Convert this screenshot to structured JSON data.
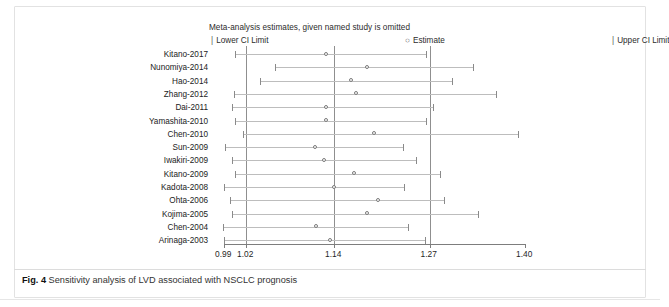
{
  "figure": {
    "caption_label": "Fig. 4",
    "caption_text": "Sensitivity analysis of LVD associated with NSCLC prognosis"
  },
  "legend": {
    "title": "Meta-analysis estimates, given named study is omitted",
    "lower_marker": "|",
    "lower_label": "Lower CI Limit",
    "estimate_marker": "○",
    "estimate_label": "Estimate",
    "upper_marker": "|",
    "upper_label": "Upper CI Limit"
  },
  "axis": {
    "ticks": [
      "0.99",
      "1.02",
      "1.14",
      "1.27",
      "1.40"
    ],
    "tick_values": [
      0.99,
      1.02,
      1.14,
      1.27,
      1.4
    ],
    "min": 0.99,
    "max": 1.4
  },
  "reference_lines": [
    1.02,
    1.14,
    1.27
  ],
  "chart_data": {
    "type": "scatter",
    "title": "Meta-analysis estimates, given named study is omitted",
    "xlabel": "",
    "ylabel": "",
    "xlim": [
      0.99,
      1.4
    ],
    "grid": false,
    "legend_position": "top",
    "categories": [
      "Kitano-2017",
      "Nunomiya-2014",
      "Hao-2014",
      "Zhang-2012",
      "Dai-2011",
      "Yamashita-2010",
      "Chen-2010",
      "Sun-2009",
      "Iwakiri-2009",
      "Kitano-2009",
      "Kadota-2008",
      "Ohta-2006",
      "Kojima-2005",
      "Chen-2004",
      "Arinaga-2003"
    ],
    "series": [
      {
        "name": "Lower CI Limit",
        "values": [
          1.005,
          1.059,
          1.039,
          1.004,
          1.001,
          1.005,
          1.016,
          0.992,
          1.001,
          1.005,
          0.99,
          0.998,
          1.001,
          0.988,
          0.99
        ]
      },
      {
        "name": "Estimate",
        "values": [
          1.13,
          1.186,
          1.163,
          1.171,
          1.13,
          1.129,
          1.195,
          1.115,
          1.127,
          1.168,
          1.14,
          1.2,
          1.186,
          1.116,
          1.135
        ]
      },
      {
        "name": "Upper CI Limit",
        "values": [
          1.265,
          1.329,
          1.3,
          1.36,
          1.275,
          1.265,
          1.39,
          1.234,
          1.251,
          1.284,
          1.235,
          1.29,
          1.336,
          1.241,
          1.264
        ]
      }
    ]
  },
  "rows": [
    {
      "label": "Kitano-2017",
      "lower": 1.005,
      "estimate": 1.13,
      "upper": 1.265
    },
    {
      "label": "Nunomiya-2014",
      "lower": 1.059,
      "estimate": 1.186,
      "upper": 1.329
    },
    {
      "label": "Hao-2014",
      "lower": 1.039,
      "estimate": 1.163,
      "upper": 1.3
    },
    {
      "label": "Zhang-2012",
      "lower": 1.004,
      "estimate": 1.171,
      "upper": 1.36
    },
    {
      "label": "Dai-2011",
      "lower": 1.001,
      "estimate": 1.13,
      "upper": 1.275
    },
    {
      "label": "Yamashita-2010",
      "lower": 1.005,
      "estimate": 1.129,
      "upper": 1.265
    },
    {
      "label": "Chen-2010",
      "lower": 1.016,
      "estimate": 1.195,
      "upper": 1.39
    },
    {
      "label": "Sun-2009",
      "lower": 0.992,
      "estimate": 1.115,
      "upper": 1.234
    },
    {
      "label": "Iwakiri-2009",
      "lower": 1.001,
      "estimate": 1.127,
      "upper": 1.251
    },
    {
      "label": "Kitano-2009",
      "lower": 1.005,
      "estimate": 1.168,
      "upper": 1.284
    },
    {
      "label": "Kadota-2008",
      "lower": 0.99,
      "estimate": 1.14,
      "upper": 1.235
    },
    {
      "label": "Ohta-2006",
      "lower": 0.998,
      "estimate": 1.2,
      "upper": 1.29
    },
    {
      "label": "Kojima-2005",
      "lower": 1.001,
      "estimate": 1.186,
      "upper": 1.336
    },
    {
      "label": "Chen-2004",
      "lower": 0.988,
      "estimate": 1.116,
      "upper": 1.241
    },
    {
      "label": "Arinaga-2003",
      "lower": 0.99,
      "estimate": 1.135,
      "upper": 1.264
    }
  ]
}
